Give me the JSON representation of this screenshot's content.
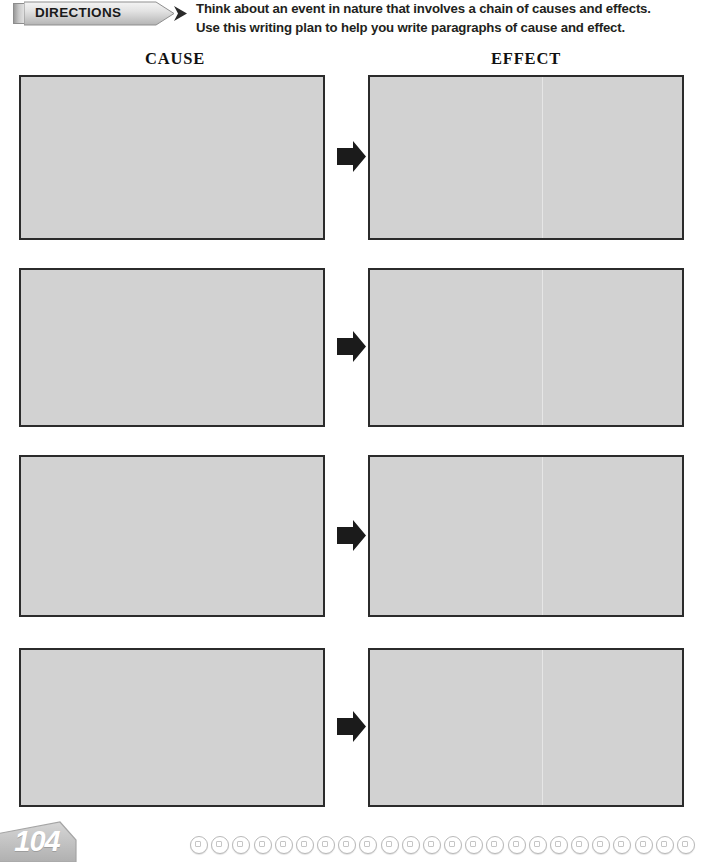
{
  "worksheet": {
    "directions": {
      "banner_label": "DIRECTIONS",
      "line1": "Think about an event in nature that involves a chain of causes and effects.",
      "line2": "Use this writing plan to help you write paragraphs of cause and effect."
    },
    "columns": {
      "cause_heading": "CAUSE",
      "effect_heading": "EFFECT"
    },
    "rows": [
      {
        "cause_value": "",
        "effect_value": "",
        "connector": "right-arrow"
      },
      {
        "cause_value": "",
        "effect_value": "",
        "connector": "right-arrow"
      },
      {
        "cause_value": "",
        "effect_value": "",
        "connector": "right-arrow"
      },
      {
        "cause_value": "",
        "effect_value": "",
        "connector": "right-arrow"
      }
    ],
    "footer": {
      "page_number": "104",
      "binding_ring_count": 24
    },
    "colors": {
      "box_fill": "#d2d2d2",
      "box_border": "#2b2b2b",
      "arrow": "#1b1b1b",
      "banner_gray": "#c9c9c9",
      "text": "#231f20",
      "page_tab_gray": "#c2c2c2"
    }
  }
}
